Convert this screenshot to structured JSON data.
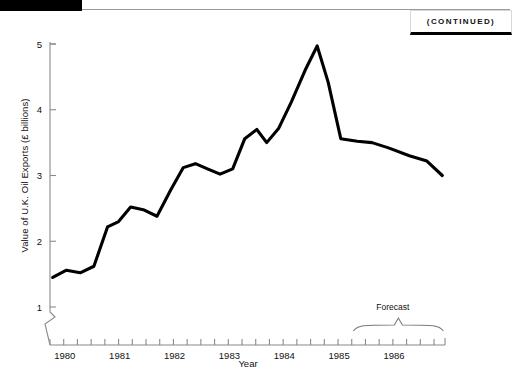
{
  "header": {
    "continued_label": "(CONTINUED)",
    "black_bar": "decorative-black-bar"
  },
  "chart_data": {
    "type": "line",
    "title": "",
    "xlabel": "Year",
    "ylabel": "Value of U.K. Oil Exports (£ billions)",
    "xlim": [
      1979.75,
      1986.95
    ],
    "ylim": [
      0.82,
      5.2
    ],
    "yticks": [
      1,
      2,
      3,
      4,
      5
    ],
    "ytick_labels": [
      "1",
      "2",
      "3",
      "4",
      "5"
    ],
    "xtick_labels": [
      "1980",
      "1981",
      "1982",
      "1983",
      "1984",
      "1985",
      "1986"
    ],
    "xtick_values": [
      1980,
      1981,
      1982,
      1983,
      1984,
      1985,
      1986
    ],
    "minor_tick_interval_quarters": 1,
    "axis_break": true,
    "grid": false,
    "legend": null,
    "units": "£ billions",
    "series": [
      {
        "name": "Value of U.K. Oil Exports",
        "color": "#000000",
        "x": [
          1979.8,
          1980.05,
          1980.3,
          1980.55,
          1980.8,
          1981.0,
          1981.22,
          1981.45,
          1981.7,
          1981.95,
          1982.18,
          1982.4,
          1982.62,
          1982.85,
          1983.08,
          1983.3,
          1983.52,
          1983.7,
          1983.92,
          1984.15,
          1984.4,
          1984.62,
          1984.82,
          1985.05,
          1985.35,
          1985.62,
          1985.92,
          1986.3,
          1986.62,
          1986.9
        ],
        "y": [
          1.45,
          1.56,
          1.52,
          1.62,
          2.22,
          2.3,
          2.52,
          2.48,
          2.38,
          2.78,
          3.12,
          3.18,
          3.1,
          3.02,
          3.1,
          3.56,
          3.7,
          3.5,
          3.72,
          4.12,
          4.6,
          4.97,
          4.42,
          3.56,
          3.52,
          3.5,
          3.42,
          3.3,
          3.22,
          3.0
        ]
      }
    ],
    "annotations": [
      {
        "name": "forecast-bracket",
        "label": "Forecast",
        "x_start": 1985.28,
        "x_end": 1986.92,
        "label_x": 1986.1
      }
    ]
  }
}
